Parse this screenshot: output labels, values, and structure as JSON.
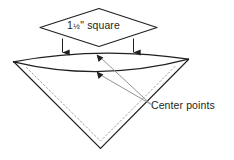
{
  "diagram": {
    "background_color": "#ffffff",
    "line_color": "#231f20",
    "leader_color": "#8c8c8c",
    "dashed_color": "#9a9a9a",
    "labels": {
      "square_whole": "1",
      "square_fraction": "½",
      "square_unit_and_name": "\" square",
      "square_full_text": "1½\" square",
      "center_points": "Center points"
    },
    "annotations": {
      "down_arrow_left": "down-arrow-left",
      "down_arrow_right": "down-arrow-right",
      "center_point_arrow_upper": "center-point-arrow-upper",
      "center_point_arrow_lower": "center-point-arrow-lower"
    },
    "shapes": {
      "diamond_label": "1½\" square diamond outline",
      "lens_label": "cone opening lens",
      "cone_label": "cone body triangle",
      "dashed_label": "hidden fold lines"
    }
  }
}
